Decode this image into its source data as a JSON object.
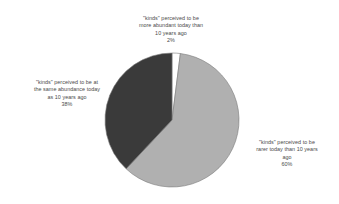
{
  "chart_data": {
    "type": "pie",
    "title": "",
    "subtitle": "",
    "xlabel": "",
    "ylabel": "",
    "legend_position": "none",
    "grid": false,
    "labels_outside": true,
    "start_angle_deg": 0,
    "direction": "clockwise",
    "categories": [
      "\"kinds\" perceived to be more abundant today than 10 years ago",
      "\"kinds\" perceived to be rarer today than 10 years ago",
      "\"kinds\" perceived to be at the same abundance today as 10 years ago"
    ],
    "values": [
      2,
      60,
      38
    ],
    "value_labels": [
      "2%",
      "60%",
      "38%"
    ],
    "colors": [
      "#ffffff",
      "#b0b0b0",
      "#3a3a3a"
    ],
    "slices": [
      {
        "name": "more-abundant",
        "label": "\"kinds\" perceived to be\nmore abundant today than\n10 years ago",
        "percent_label": "2%",
        "value": 2,
        "color": "#ffffff"
      },
      {
        "name": "rarer",
        "label": "\"kinds\" perceived to be\nrarer today than 10 years\nago",
        "percent_label": "60%",
        "value": 60,
        "color": "#b0b0b0"
      },
      {
        "name": "same-abundance",
        "label": "\"kinds\" perceived to be at\nthe same abundance today\nas 10 years ago",
        "percent_label": "38%",
        "value": 38,
        "color": "#3a3a3a"
      }
    ]
  },
  "style": {
    "background": "#ffffff",
    "text_color": "#4a4a4a",
    "outline_color": "#7a7a7a"
  }
}
